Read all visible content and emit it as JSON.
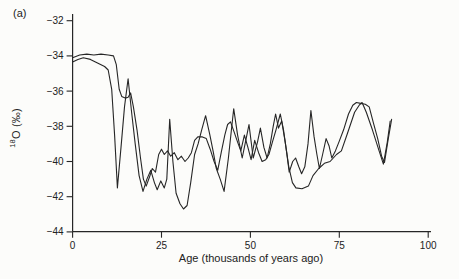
{
  "chart_data": {
    "type": "line",
    "panel_label": "(a)",
    "title": "",
    "xlabel": "Age (thousands of years ago)",
    "ylabel_sup": "18",
    "ylabel_main": "O (‰)",
    "xlim": [
      0,
      100
    ],
    "ylim": [
      -44,
      -32
    ],
    "x_ticks": [
      0,
      25,
      50,
      75,
      100
    ],
    "y_ticks": [
      -32,
      -34,
      -36,
      -38,
      -40,
      -42,
      -44
    ],
    "grid": false,
    "legend": null,
    "line_color": "#262626",
    "axis_color": "#262626",
    "series": [
      {
        "name": "ice-core-record-1",
        "points": [
          [
            0,
            -34.35
          ],
          [
            1.5,
            -34.2
          ],
          [
            3,
            -34.1
          ],
          [
            5,
            -34.2
          ],
          [
            7,
            -34.4
          ],
          [
            9,
            -34.6
          ],
          [
            10,
            -34.8
          ],
          [
            11,
            -35.9
          ],
          [
            11.8,
            -38.5
          ],
          [
            12.6,
            -41.5
          ],
          [
            13.6,
            -39.2
          ],
          [
            14.6,
            -36.9
          ],
          [
            15.6,
            -35.3
          ],
          [
            16.6,
            -37.2
          ],
          [
            17.6,
            -39.0
          ],
          [
            18.7,
            -40.8
          ],
          [
            19.8,
            -41.7
          ],
          [
            20.9,
            -41.0
          ],
          [
            22,
            -40.5
          ],
          [
            23,
            -41.2
          ],
          [
            23.8,
            -41.6
          ],
          [
            24.8,
            -41.1
          ],
          [
            25.8,
            -41.5
          ],
          [
            26.5,
            -41.0
          ],
          [
            27.3,
            -37.6
          ],
          [
            28.2,
            -40.0
          ],
          [
            29.1,
            -41.8
          ],
          [
            30.2,
            -42.4
          ],
          [
            31.2,
            -42.7
          ],
          [
            32.2,
            -42.5
          ],
          [
            33.2,
            -41.2
          ],
          [
            34.3,
            -39.6
          ],
          [
            35.3,
            -39.0
          ],
          [
            36.3,
            -38.2
          ],
          [
            37.4,
            -37.4
          ],
          [
            38.6,
            -38.5
          ],
          [
            39.6,
            -39.5
          ],
          [
            40.4,
            -40.4
          ],
          [
            41.5,
            -41.0
          ],
          [
            42.6,
            -41.7
          ],
          [
            43.8,
            -39.8
          ],
          [
            45.3,
            -37.0
          ],
          [
            46.4,
            -38.5
          ],
          [
            47.7,
            -39.8
          ],
          [
            48.7,
            -38.8
          ],
          [
            49.6,
            -37.9
          ],
          [
            50.8,
            -39.8
          ],
          [
            52,
            -38.9
          ],
          [
            52.8,
            -38.1
          ],
          [
            53.8,
            -39.2
          ],
          [
            54.7,
            -39.8
          ],
          [
            55.6,
            -39.0
          ],
          [
            56.4,
            -38.0
          ],
          [
            57.1,
            -37.3
          ],
          [
            57.9,
            -38.1
          ],
          [
            58.8,
            -37.7
          ],
          [
            59.8,
            -38.9
          ],
          [
            60.8,
            -40.3
          ],
          [
            61.8,
            -41.2
          ],
          [
            62.8,
            -41.5
          ],
          [
            64.5,
            -41.55
          ],
          [
            66.3,
            -41.4
          ],
          [
            67.6,
            -40.8
          ],
          [
            69.2,
            -40.4
          ],
          [
            70.8,
            -40.1
          ],
          [
            72.4,
            -40.0
          ],
          [
            74.2,
            -39.6
          ],
          [
            75.6,
            -39.4
          ],
          [
            77.3,
            -38.4
          ],
          [
            79.3,
            -37.2
          ],
          [
            80.6,
            -36.8
          ],
          [
            81.4,
            -36.65
          ],
          [
            82.6,
            -37.2
          ],
          [
            84.3,
            -38.2
          ],
          [
            86.2,
            -39.4
          ],
          [
            87.4,
            -40.15
          ],
          [
            88.5,
            -38.9
          ],
          [
            89.3,
            -37.7
          ]
        ]
      },
      {
        "name": "ice-core-record-2",
        "points": [
          [
            0,
            -34.1
          ],
          [
            2,
            -33.95
          ],
          [
            4,
            -33.9
          ],
          [
            6,
            -33.95
          ],
          [
            8,
            -33.9
          ],
          [
            10,
            -33.95
          ],
          [
            11.5,
            -34.0
          ],
          [
            12.3,
            -34.5
          ],
          [
            13.1,
            -35.9
          ],
          [
            13.8,
            -36.3
          ],
          [
            14.8,
            -36.4
          ],
          [
            15.6,
            -36.35
          ],
          [
            16.3,
            -36.1
          ],
          [
            17.1,
            -36.9
          ],
          [
            18.1,
            -38.2
          ],
          [
            19.1,
            -39.8
          ],
          [
            19.9,
            -41.0
          ],
          [
            20.7,
            -41.4
          ],
          [
            21.6,
            -40.9
          ],
          [
            22.4,
            -40.4
          ],
          [
            23.3,
            -40.6
          ],
          [
            24.2,
            -39.6
          ],
          [
            25,
            -39.3
          ],
          [
            25.8,
            -39.6
          ],
          [
            26.7,
            -39.4
          ],
          [
            27.6,
            -39.7
          ],
          [
            28.6,
            -39.5
          ],
          [
            29.6,
            -39.9
          ],
          [
            30.6,
            -39.7
          ],
          [
            31.6,
            -40.0
          ],
          [
            32.5,
            -39.8
          ],
          [
            33.4,
            -39.5
          ],
          [
            34.3,
            -38.8
          ],
          [
            35.2,
            -38.6
          ],
          [
            36.5,
            -38.6
          ],
          [
            37.6,
            -38.7
          ],
          [
            38.7,
            -39.3
          ],
          [
            39.8,
            -40.0
          ],
          [
            40.8,
            -40.5
          ],
          [
            41.8,
            -39.5
          ],
          [
            42.8,
            -38.5
          ],
          [
            43.6,
            -37.9
          ],
          [
            44.4,
            -37.75
          ],
          [
            45.4,
            -38.3
          ],
          [
            46.4,
            -38.9
          ],
          [
            47.3,
            -39.4
          ],
          [
            48.3,
            -38.5
          ],
          [
            49.3,
            -39.2
          ],
          [
            50.2,
            -39.9
          ],
          [
            51.2,
            -38.8
          ],
          [
            52.3,
            -39.5
          ],
          [
            53.3,
            -40.0
          ],
          [
            54.3,
            -39.9
          ],
          [
            55.2,
            -39.6
          ],
          [
            56.2,
            -38.9
          ],
          [
            57.2,
            -38.2
          ],
          [
            58.4,
            -37.3
          ],
          [
            59.3,
            -38.2
          ],
          [
            60.2,
            -39.5
          ],
          [
            60.9,
            -40.6
          ],
          [
            61.9,
            -40.0
          ],
          [
            62.7,
            -39.8
          ],
          [
            63.6,
            -40.3
          ],
          [
            64.4,
            -40.7
          ],
          [
            65.3,
            -40.3
          ],
          [
            66.2,
            -39.0
          ],
          [
            67,
            -37.1
          ],
          [
            67.9,
            -38.6
          ],
          [
            68.7,
            -39.6
          ],
          [
            69.4,
            -40.4
          ],
          [
            70.3,
            -39.6
          ],
          [
            71.3,
            -38.7
          ],
          [
            72.1,
            -39.1
          ],
          [
            72.9,
            -39.8
          ],
          [
            73.9,
            -39.4
          ],
          [
            74.9,
            -38.9
          ],
          [
            76.2,
            -38.2
          ],
          [
            77.6,
            -37.3
          ],
          [
            78.8,
            -36.8
          ],
          [
            79.8,
            -36.65
          ],
          [
            81,
            -36.7
          ],
          [
            82.3,
            -36.75
          ],
          [
            83.4,
            -36.9
          ],
          [
            84.6,
            -37.8
          ],
          [
            85.8,
            -38.7
          ],
          [
            86.9,
            -39.7
          ],
          [
            87.7,
            -40.05
          ],
          [
            88.7,
            -38.8
          ],
          [
            89.7,
            -37.6
          ]
        ]
      }
    ],
    "plot_geometry": {
      "x0_px": 72.6,
      "px_per_kyr": 3.556,
      "y_top_value_px": 20.7,
      "px_per_unit": 17.6,
      "axis_top_px": 14,
      "axis_bottom_px": 231.7,
      "axis_right_px": 431,
      "tick_len": 6
    }
  }
}
